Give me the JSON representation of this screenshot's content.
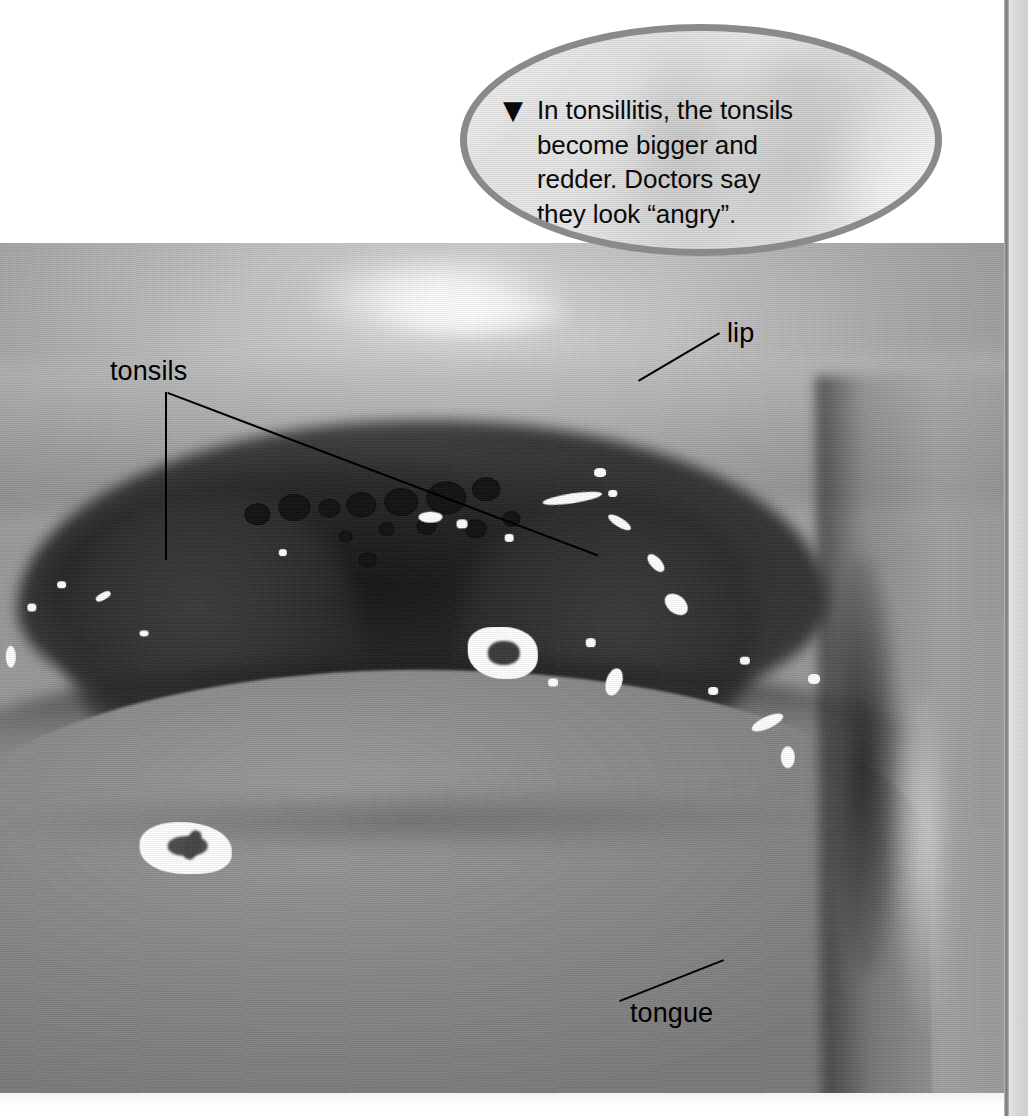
{
  "page": {
    "background_color": "#ffffff",
    "margin_strip_color": "#dcdcdc",
    "gutter_rule_color": "#7a7a7a"
  },
  "callout": {
    "icon": "down-triangle-icon",
    "icon_glyph": "▼",
    "border_color": "#8a8a8a",
    "fill_color": "#efefef",
    "lines": [
      "In tonsillitis, the tonsils",
      "become bigger and",
      "redder. Doctors say",
      "they look “angry”."
    ],
    "full_text": "In tonsillitis, the tonsils become bigger and redder. Doctors say they look “angry”."
  },
  "photo": {
    "description": "black-and-white close-up photograph of an open mouth showing inflamed tonsils",
    "labels": [
      {
        "id": "tonsils",
        "text": "tonsils",
        "x": 110,
        "y": 356
      },
      {
        "id": "lip",
        "text": "lip",
        "x": 727,
        "y": 318
      },
      {
        "id": "tongue",
        "text": "tongue",
        "x": 630,
        "y": 998
      }
    ],
    "leader_lines": [
      {
        "id": "tonsils-vertical",
        "x1": 165,
        "y1": 392,
        "x2": 165,
        "y2": 560
      },
      {
        "id": "tonsils-diagonal",
        "x1": 168,
        "y1": 392,
        "x2": 597,
        "y2": 554
      },
      {
        "id": "lip-diagonal",
        "x1": 638,
        "y1": 379,
        "x2": 718,
        "y2": 331
      },
      {
        "id": "tongue-diagonal",
        "x1": 723,
        "y1": 962,
        "x2": 620,
        "y2": 1004
      }
    ],
    "label_color": "#000000",
    "leader_color": "#000000"
  }
}
